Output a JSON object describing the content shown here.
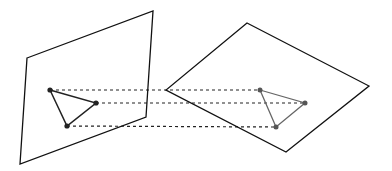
{
  "diagram": {
    "colors": {
      "plane_stroke": "#111111",
      "left_triangle": "#222222",
      "right_triangle": "#666666",
      "dash": "#222222"
    },
    "left_plane": [
      [
        27,
        58
      ],
      [
        153,
        11
      ],
      [
        146,
        117
      ],
      [
        20,
        164
      ]
    ],
    "right_plane": [
      [
        247,
        23
      ],
      [
        369,
        86
      ],
      [
        286,
        152
      ],
      [
        166,
        90
      ]
    ],
    "left_triangle": [
      [
        50,
        90
      ],
      [
        96,
        103
      ],
      [
        67,
        126
      ]
    ],
    "right_triangle": [
      [
        260,
        90
      ],
      [
        305,
        103
      ],
      [
        276,
        127
      ]
    ]
  }
}
